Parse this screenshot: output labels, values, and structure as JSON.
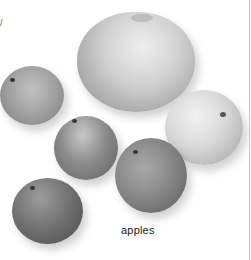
{
  "image": {
    "description": "Grayscale illustration of six apples on a white background",
    "caption": "apples",
    "corner_mark": "/"
  },
  "apples": [
    {
      "id": "large-top",
      "tone": "#c9c9c9"
    },
    {
      "id": "left",
      "tone": "#9a9a9a"
    },
    {
      "id": "right",
      "tone": "#d6d6d6"
    },
    {
      "id": "middle",
      "tone": "#7d7d7d"
    },
    {
      "id": "center-bottom",
      "tone": "#858585"
    },
    {
      "id": "bottom-left",
      "tone": "#6e6e6e"
    }
  ]
}
